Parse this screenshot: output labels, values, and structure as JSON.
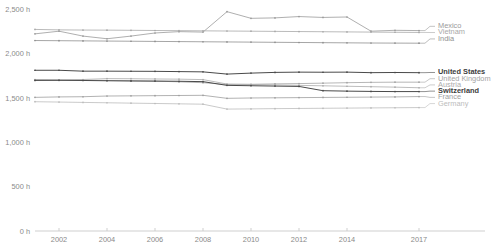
{
  "chart_data": {
    "type": "line",
    "title": "",
    "subtitle": "",
    "xlabel": "",
    "ylabel": "",
    "xlim": [
      2001,
      2017
    ],
    "ylim": [
      0,
      2500
    ],
    "grid": false,
    "legend_position": "right",
    "x": [
      2001,
      2002,
      2003,
      2004,
      2005,
      2006,
      2007,
      2008,
      2009,
      2010,
      2011,
      2012,
      2013,
      2014,
      2015,
      2016,
      2017
    ],
    "y_ticks": [
      {
        "value": 0,
        "label": "0 h"
      },
      {
        "value": 500,
        "label": "500 h"
      },
      {
        "value": 1000,
        "label": "1,000 h"
      },
      {
        "value": 1500,
        "label": "1,500 h"
      },
      {
        "value": 2000,
        "label": "2,000 h"
      },
      {
        "value": 2500,
        "label": "2,500 h"
      }
    ],
    "x_ticks": [
      {
        "value": 2002,
        "label": "2002"
      },
      {
        "value": 2004,
        "label": "2004"
      },
      {
        "value": 2006,
        "label": "2006"
      },
      {
        "value": 2008,
        "label": "2008"
      },
      {
        "value": 2010,
        "label": "2010"
      },
      {
        "value": 2012,
        "label": "2012"
      },
      {
        "value": 2014,
        "label": "2014"
      },
      {
        "value": 2017,
        "label": "2017"
      }
    ],
    "series": [
      {
        "name": "Mexico",
        "color": "#9a9a9a",
        "emphasis": "normal",
        "label_y": 2305,
        "values": [
          2220,
          2250,
          2195,
          2165,
          2195,
          2230,
          2245,
          2240,
          2470,
          2395,
          2400,
          2415,
          2405,
          2410,
          2250,
          2260,
          2257
        ]
      },
      {
        "name": "Vietnam",
        "color": "#a8a8a8",
        "emphasis": "normal",
        "label_y": 2235,
        "values": [
          2270,
          2265,
          2263,
          2262,
          2260,
          2258,
          2256,
          2254,
          2252,
          2250,
          2248,
          2246,
          2244,
          2242,
          2240,
          2238,
          2236
        ]
      },
      {
        "name": "India",
        "color": "#8f8f8f",
        "emphasis": "normal",
        "label_y": 2163,
        "values": [
          2145,
          2143,
          2141,
          2139,
          2137,
          2135,
          2133,
          2131,
          2129,
          2127,
          2125,
          2123,
          2121,
          2119,
          2117,
          2116,
          2115
        ]
      },
      {
        "name": "United States",
        "color": "#4a4a4a",
        "emphasis": "bold",
        "label_y": 1785,
        "values": [
          1810,
          1810,
          1800,
          1800,
          1799,
          1798,
          1795,
          1792,
          1767,
          1778,
          1786,
          1789,
          1788,
          1789,
          1783,
          1785,
          1783
        ]
      },
      {
        "name": "United Kingdom",
        "color": "#a3a3a3",
        "emphasis": "normal",
        "label_y": 1715,
        "values": [
          1705,
          1700,
          1698,
          1695,
          1690,
          1688,
          1680,
          1670,
          1650,
          1652,
          1657,
          1660,
          1665,
          1670,
          1674,
          1676,
          1676
        ]
      },
      {
        "name": "Austria",
        "color": "#ababab",
        "emphasis": "normal",
        "label_y": 1645,
        "values": [
          1700,
          1700,
          1706,
          1716,
          1715,
          1712,
          1710,
          1705,
          1655,
          1650,
          1645,
          1640,
          1635,
          1630,
          1625,
          1620,
          1613
        ]
      },
      {
        "name": "Switzerland",
        "color": "#4a4a4a",
        "emphasis": "bold",
        "label_y": 1575,
        "values": [
          1696,
          1697,
          1695,
          1692,
          1690,
          1688,
          1686,
          1682,
          1640,
          1636,
          1632,
          1628,
          1580,
          1575,
          1572,
          1570,
          1570
        ]
      },
      {
        "name": "France",
        "color": "#9e9e9e",
        "emphasis": "normal",
        "label_y": 1505,
        "values": [
          1505,
          1510,
          1512,
          1520,
          1522,
          1524,
          1526,
          1528,
          1494,
          1498,
          1500,
          1502,
          1504,
          1506,
          1508,
          1510,
          1514
        ]
      },
      {
        "name": "Germany",
        "color": "#bcbcbc",
        "emphasis": "normal",
        "label_y": 1435,
        "values": [
          1456,
          1452,
          1448,
          1444,
          1440,
          1436,
          1432,
          1428,
          1373,
          1375,
          1378,
          1380,
          1382,
          1384,
          1386,
          1388,
          1390
        ]
      }
    ]
  }
}
